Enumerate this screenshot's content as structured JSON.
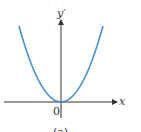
{
  "diagram": {
    "y_axis_label": "y′",
    "x_axis_label": "x",
    "origin_label": "0",
    "caption": "(a)",
    "curve": "parabola y' = x^2 (vertex at origin, opening upward)",
    "curve_color": "#4a90c8",
    "axis_color": "#333333"
  }
}
